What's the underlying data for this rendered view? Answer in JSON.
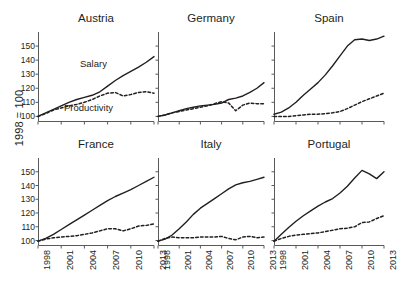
{
  "figure": {
    "ylabel": "1998 = 100",
    "annotations": {
      "salary": "Salary",
      "productivity": "Productivity"
    }
  },
  "chart_data": {
    "type": "line",
    "title": "",
    "xlabel": "",
    "ylabel": "1998 = 100",
    "grid": false,
    "legend_position": "inline-annotation",
    "xlim": [
      1998,
      2013
    ],
    "ylim": [
      96,
      160
    ],
    "yticks": [
      100,
      110,
      120,
      130,
      140,
      150
    ],
    "xticks": [
      1998,
      2001,
      2004,
      2007,
      2010,
      2013
    ],
    "xtick_labels": [
      "1998",
      "2001",
      "2004",
      "2007",
      "2010",
      "2013"
    ],
    "ytick_labels": [
      "100",
      "110",
      "120",
      "130",
      "140",
      "150"
    ],
    "x": [
      1998,
      1999,
      2000,
      2001,
      2002,
      2003,
      2004,
      2005,
      2006,
      2007,
      2008,
      2009,
      2010,
      2011,
      2012,
      2013
    ],
    "series_styles": [
      {
        "name": "Salary",
        "style": "solid",
        "color": "#231f20"
      },
      {
        "name": "Productivity",
        "style": "dashed",
        "color": "#231f20"
      }
    ],
    "panels": [
      {
        "name": "Austria",
        "series": [
          {
            "name": "Salary",
            "values": [
              100.0,
              102.5,
              105.0,
              107.5,
              110.0,
              112.0,
              113.5,
              115.0,
              117.5,
              121.5,
              125.5,
              129.0,
              132.0,
              135.0,
              138.5,
              142.5
            ]
          },
          {
            "name": "Productivity",
            "values": [
              100.0,
              102.0,
              104.5,
              106.0,
              107.5,
              108.5,
              110.0,
              112.0,
              114.5,
              116.5,
              117.0,
              114.5,
              115.5,
              117.0,
              117.5,
              116.5
            ]
          }
        ]
      },
      {
        "name": "Germany",
        "series": [
          {
            "name": "Salary",
            "values": [
              100.0,
              101.0,
              102.5,
              104.0,
              105.5,
              106.5,
              107.5,
              108.0,
              108.5,
              109.5,
              112.0,
              113.0,
              114.5,
              117.0,
              120.0,
              124.0
            ]
          },
          {
            "name": "Productivity",
            "values": [
              100.0,
              101.0,
              102.5,
              103.5,
              104.5,
              105.5,
              106.5,
              107.5,
              109.0,
              110.5,
              109.5,
              104.0,
              108.0,
              109.5,
              109.0,
              109.0
            ]
          }
        ]
      },
      {
        "name": "Spain",
        "series": [
          {
            "name": "Salary",
            "values": [
              101.5,
              103.0,
              106.0,
              110.0,
              115.0,
              119.5,
              124.0,
              129.5,
              136.0,
              143.0,
              150.0,
              154.5,
              155.0,
              154.0,
              155.0,
              157.0
            ]
          },
          {
            "name": "Productivity",
            "values": [
              100.0,
              100.0,
              100.0,
              100.5,
              101.0,
              101.5,
              101.5,
              102.0,
              102.5,
              103.5,
              105.5,
              108.0,
              110.5,
              112.5,
              114.5,
              116.5
            ]
          }
        ]
      },
      {
        "name": "France",
        "series": [
          {
            "name": "Salary",
            "values": [
              99.5,
              101.5,
              104.5,
              108.0,
              111.5,
              115.0,
              118.5,
              122.0,
              125.5,
              129.0,
              132.0,
              134.5,
              137.0,
              140.0,
              143.0,
              146.0
            ]
          },
          {
            "name": "Productivity",
            "values": [
              99.5,
              101.0,
              102.0,
              102.5,
              103.0,
              103.5,
              104.5,
              105.5,
              107.0,
              108.5,
              108.5,
              107.0,
              108.5,
              110.5,
              111.0,
              112.0
            ]
          }
        ]
      },
      {
        "name": "Italy",
        "series": [
          {
            "name": "Salary",
            "values": [
              99.5,
              101.0,
              104.0,
              108.5,
              113.5,
              119.0,
              123.5,
              127.0,
              130.5,
              134.0,
              137.5,
              140.5,
              142.0,
              143.0,
              144.5,
              146.0
            ]
          },
          {
            "name": "Productivity",
            "values": [
              99.5,
              101.5,
              102.5,
              102.0,
              102.0,
              102.0,
              102.5,
              102.5,
              102.5,
              103.0,
              101.5,
              100.5,
              102.5,
              103.0,
              102.0,
              102.5
            ]
          }
        ]
      },
      {
        "name": "Portugal",
        "series": [
          {
            "name": "Salary",
            "values": [
              99.5,
              104.5,
              109.5,
              114.0,
              118.0,
              121.5,
              125.0,
              128.0,
              130.5,
              134.5,
              139.5,
              145.5,
              151.0,
              148.5,
              145.0,
              150.0
            ]
          },
          {
            "name": "Productivity",
            "values": [
              99.5,
              101.5,
              103.0,
              104.0,
              104.5,
              105.0,
              105.5,
              106.5,
              107.5,
              108.5,
              109.0,
              110.0,
              113.0,
              113.5,
              116.0,
              118.0
            ]
          }
        ]
      }
    ]
  }
}
